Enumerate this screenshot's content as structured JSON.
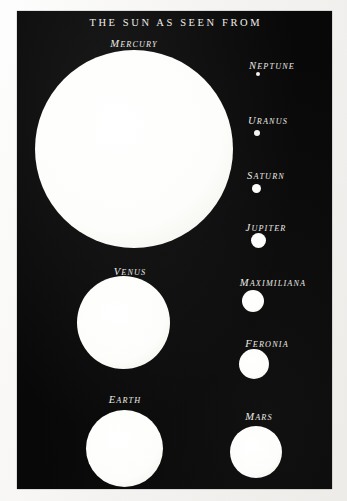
{
  "plate": {
    "title": "THE SUN AS SEEN FROM",
    "background_color": "#080808",
    "paper_color": "#f7f6f4",
    "disc_color": "#fdfdfb",
    "label_color": "#eceae5"
  },
  "bodies": [
    {
      "name": "Mercury",
      "label": "Mercury",
      "column": "left",
      "disc_kind": "disc",
      "center_x": 134,
      "center_y": 149,
      "diameter": 198,
      "label_x": 134,
      "label_y": 38
    },
    {
      "name": "Venus",
      "label": "Venus",
      "column": "left",
      "disc_kind": "disc",
      "center_x": 123,
      "center_y": 322,
      "diameter": 93,
      "label_x": 130,
      "label_y": 266
    },
    {
      "name": "Earth",
      "label": "Earth",
      "column": "left",
      "disc_kind": "disc",
      "center_x": 124,
      "center_y": 448,
      "diameter": 77,
      "label_x": 125,
      "label_y": 394
    },
    {
      "name": "Neptune",
      "label": "Neptune",
      "column": "right",
      "disc_kind": "dot",
      "center_x": 258,
      "center_y": 74,
      "diameter": 4,
      "label_x": 272,
      "label_y": 60
    },
    {
      "name": "Uranus",
      "label": "Uranus",
      "column": "right",
      "disc_kind": "dot",
      "center_x": 257,
      "center_y": 133,
      "diameter": 6,
      "label_x": 268,
      "label_y": 115
    },
    {
      "name": "Saturn",
      "label": "Saturn",
      "column": "right",
      "disc_kind": "disc",
      "center_x": 256,
      "center_y": 188,
      "diameter": 9,
      "label_x": 266,
      "label_y": 170
    },
    {
      "name": "Jupiter",
      "label": "Jupiter",
      "column": "right",
      "disc_kind": "disc",
      "center_x": 258,
      "center_y": 240,
      "diameter": 15,
      "label_x": 266,
      "label_y": 222
    },
    {
      "name": "Maximiliana",
      "label": "Maximiliana",
      "column": "right",
      "disc_kind": "disc",
      "center_x": 253,
      "center_y": 301,
      "diameter": 22,
      "label_x": 273,
      "label_y": 277
    },
    {
      "name": "Feronia",
      "label": "Feronia",
      "column": "right",
      "disc_kind": "disc",
      "center_x": 254,
      "center_y": 364,
      "diameter": 30,
      "label_x": 267,
      "label_y": 338
    },
    {
      "name": "Mars",
      "label": "Mars",
      "column": "right",
      "disc_kind": "disc",
      "center_x": 256,
      "center_y": 452,
      "diameter": 52,
      "label_x": 259,
      "label_y": 411
    }
  ]
}
